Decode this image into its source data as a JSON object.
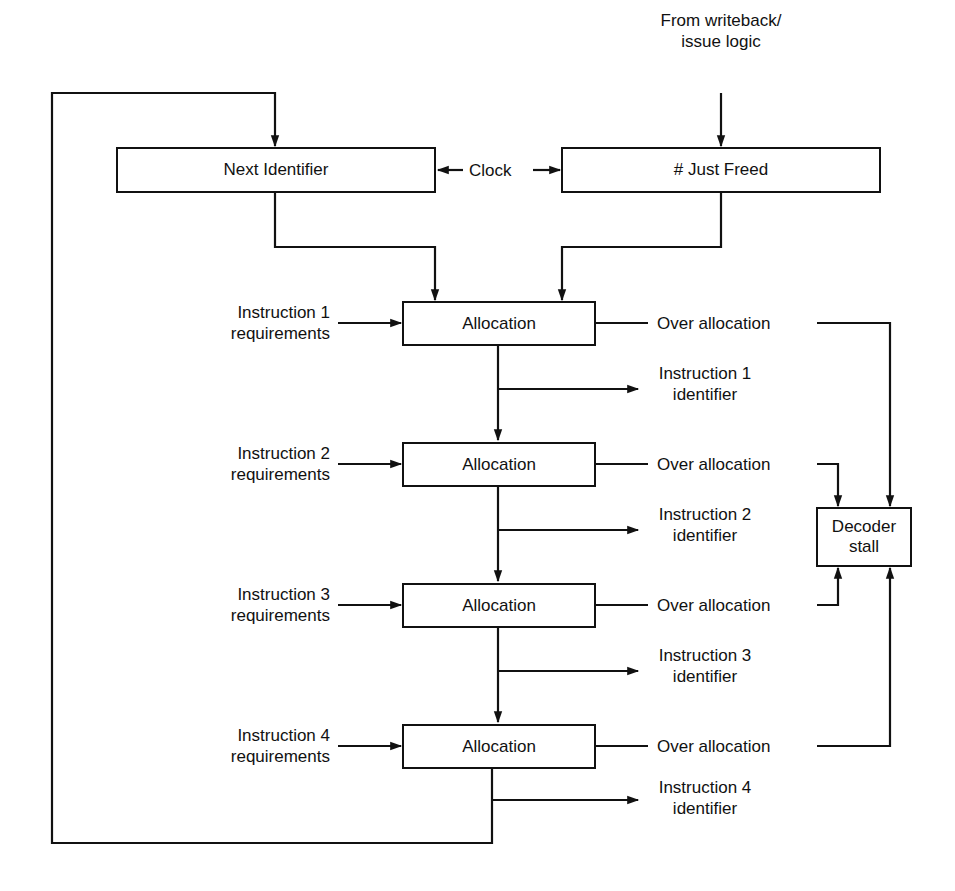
{
  "diagram": {
    "type": "block-diagram",
    "blocks": {
      "next_identifier": "Next Identifier",
      "just_freed": "# Just Freed",
      "decoder_stall": "Decoder\nstall",
      "allocation": [
        "Allocation",
        "Allocation",
        "Allocation",
        "Allocation"
      ]
    },
    "labels": {
      "source": "From writeback/\nissue logic",
      "clock": "Clock",
      "requirements": [
        "Instruction 1\nrequirements",
        "Instruction 2\nrequirements",
        "Instruction 3\nrequirements",
        "Instruction 4\nrequirements"
      ],
      "identifiers": [
        "Instruction 1\nidentifier",
        "Instruction 2\nidentifier",
        "Instruction 3\nidentifier",
        "Instruction 4\nidentifier"
      ],
      "over_allocation": [
        "Over allocation",
        "Over allocation",
        "Over allocation",
        "Over allocation"
      ]
    },
    "edges": [
      {
        "from": "From writeback/issue logic",
        "to": "# Just Freed"
      },
      {
        "from": "Clock",
        "to": "Next Identifier"
      },
      {
        "from": "Clock",
        "to": "# Just Freed"
      },
      {
        "from": "Next Identifier",
        "to": "Allocation 1"
      },
      {
        "from": "# Just Freed",
        "to": "Allocation 1"
      },
      {
        "from": "Allocation 1",
        "to": "Allocation 2"
      },
      {
        "from": "Allocation 2",
        "to": "Allocation 3"
      },
      {
        "from": "Allocation 3",
        "to": "Allocation 4"
      },
      {
        "from": "Allocation 4",
        "to": "Next Identifier",
        "note": "feedback loop"
      },
      {
        "from": "Allocation 1..4",
        "to": "Instruction 1..4 identifier"
      },
      {
        "from": "Instruction 1..4 requirements",
        "to": "Allocation 1..4"
      },
      {
        "from": "Over allocation 1..4",
        "to": "Decoder stall"
      }
    ]
  }
}
